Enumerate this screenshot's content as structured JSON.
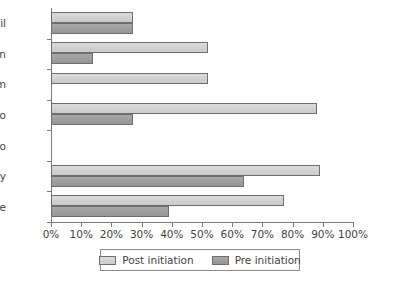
{
  "chart_data": {
    "type": "bar",
    "orientation": "horizontal",
    "title": "",
    "subtitle": "",
    "xlabel": "",
    "ylabel": "",
    "xlim": [
      0,
      100
    ],
    "ylim": null,
    "grid": false,
    "legend_position": "bottom",
    "categories": [
      "Gail",
      "Kevin",
      "Tim",
      "Leo",
      "Marco",
      "Freddy",
      "Joe"
    ],
    "xtick_labels": [
      "0%",
      "10%",
      "20%",
      "30%",
      "40%",
      "50%",
      "60%",
      "70%",
      "80%",
      "90%",
      "100%"
    ],
    "xtick_values": [
      0,
      10,
      20,
      30,
      40,
      50,
      60,
      70,
      80,
      90,
      100
    ],
    "series": [
      {
        "name": "Post initiation",
        "color": "#d4d4d4",
        "values": [
          27,
          52,
          52,
          88,
          0,
          89,
          77
        ]
      },
      {
        "name": "Pre initiation",
        "color": "#9c9c9c",
        "values": [
          27,
          14,
          0,
          27,
          0,
          64,
          39
        ]
      }
    ]
  },
  "legend": {
    "items": [
      {
        "label": "Post initiation",
        "swatch": "post"
      },
      {
        "label": "Pre initiation",
        "swatch": "pre"
      }
    ]
  },
  "axis": {
    "x_ticks": [
      "0%",
      "10%",
      "20%",
      "30%",
      "40%",
      "50%",
      "60%",
      "70%",
      "80%",
      "90%",
      "100%"
    ],
    "y_categories": [
      "Gail",
      "Kevin",
      "Tim",
      "Leo",
      "Marco",
      "Freddy",
      "Joe"
    ]
  },
  "colors": {
    "post_initiation": "#d4d4d4",
    "pre_initiation": "#9c9c9c",
    "axis": "#7b7b7b",
    "text": "#3f3f3f",
    "background": "#ffffff"
  }
}
